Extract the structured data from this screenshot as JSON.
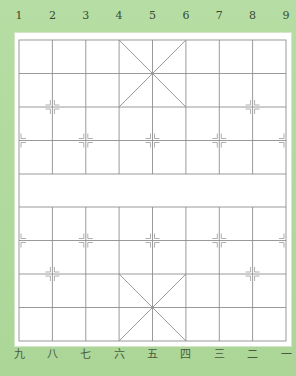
{
  "board": {
    "type": "xiangqi-empty-board",
    "columns": 9,
    "rows": 10,
    "top_labels": [
      "1",
      "2",
      "3",
      "4",
      "5",
      "6",
      "7",
      "8",
      "9"
    ],
    "bottom_labels": [
      "九",
      "八",
      "七",
      "六",
      "五",
      "四",
      "三",
      "二",
      "一"
    ],
    "river_text": "",
    "colors": {
      "background": "#b3dba0",
      "board": "#ffffff",
      "grid_line": "#8c8c8c",
      "label_text": "#3a4a30"
    }
  }
}
